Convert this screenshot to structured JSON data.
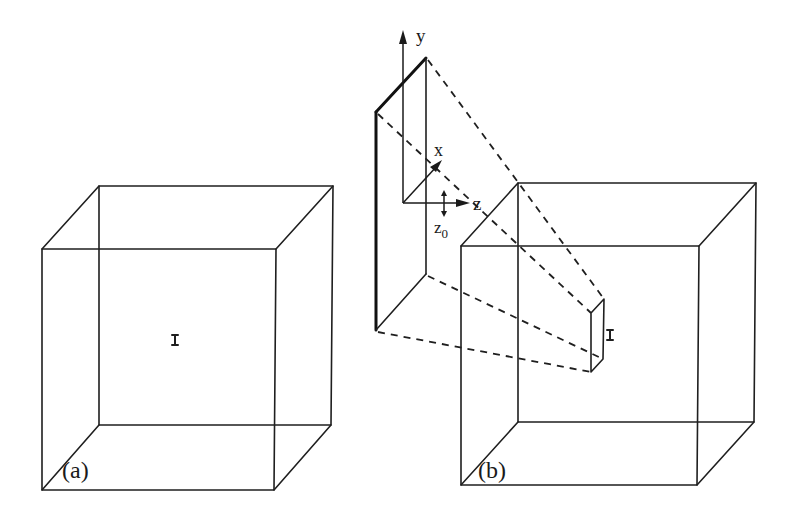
{
  "figure": {
    "colors": {
      "line": "#1f1f1f",
      "background": "#ffffff"
    },
    "panel_a": {
      "label": "(a)",
      "marker_glyph": "I"
    },
    "panel_b": {
      "label": "(b)",
      "marker_glyph": "I",
      "axes": {
        "y_label": "y",
        "x_label": "x",
        "z_label": "z",
        "z0_label": "z",
        "z0_sub": "0"
      }
    }
  }
}
